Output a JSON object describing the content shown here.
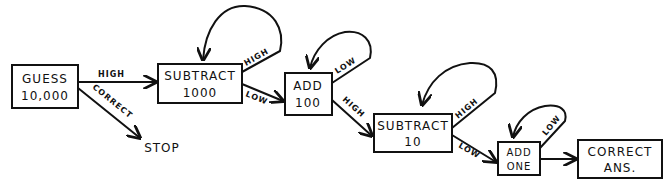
{
  "diagram": {
    "type": "flowchart",
    "style": "hand-drawn",
    "nodes": [
      {
        "id": "guess",
        "line1": "GUESS",
        "line2": "10,000"
      },
      {
        "id": "sub1000",
        "line1": "SUBTRACT",
        "line2": "1000"
      },
      {
        "id": "add100",
        "line1": "ADD",
        "line2": "100"
      },
      {
        "id": "sub10",
        "line1": "SUBTRACT",
        "line2": "10"
      },
      {
        "id": "addone",
        "line1": "ADD",
        "line2": "ONE"
      },
      {
        "id": "correct",
        "line1": "CORRECT",
        "line2": "ANS."
      },
      {
        "id": "stop",
        "line1": "STOP"
      }
    ],
    "edges": [
      {
        "from": "guess",
        "to": "sub1000",
        "label": "HIGH"
      },
      {
        "from": "guess",
        "to": "stop",
        "label": "CORRECT"
      },
      {
        "from": "sub1000",
        "to": "sub1000",
        "label": "HIGH"
      },
      {
        "from": "sub1000",
        "to": "add100",
        "label": "LOW"
      },
      {
        "from": "add100",
        "to": "add100",
        "label": "LOW"
      },
      {
        "from": "add100",
        "to": "sub10",
        "label": "HIGH"
      },
      {
        "from": "sub10",
        "to": "sub10",
        "label": "HIGH"
      },
      {
        "from": "sub10",
        "to": "addone",
        "label": "LOW"
      },
      {
        "from": "addone",
        "to": "addone",
        "label": "LOW"
      },
      {
        "from": "addone",
        "to": "correct",
        "label": ""
      }
    ]
  }
}
